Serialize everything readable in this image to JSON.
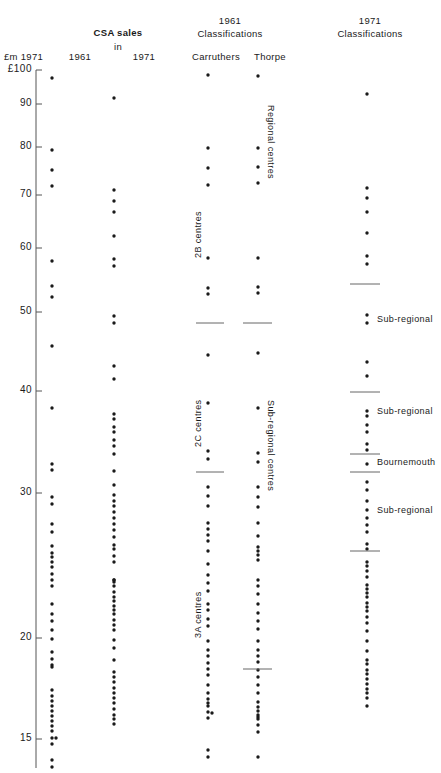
{
  "headers": {
    "csa_sales": "CSA sales",
    "in": "in",
    "axis_unit": "£m 1971",
    "col_1961": "1961",
    "col_1971": "1971",
    "classif_1961_year": "1961",
    "classif_1961": "Classifications",
    "classif_1971_year": "1971",
    "classif_1971": "Classifications",
    "carruthers": "Carruthers",
    "thorpe": "Thorpe"
  },
  "axis": {
    "ticks": [
      {
        "label": "£100",
        "value": 100,
        "y": 70
      },
      {
        "label": "90",
        "value": 90,
        "y": 104
      },
      {
        "label": "80",
        "value": 80,
        "y": 147
      },
      {
        "label": "70",
        "value": 70,
        "y": 195
      },
      {
        "label": "60",
        "value": 60,
        "y": 248
      },
      {
        "label": "50",
        "value": 50,
        "y": 312
      },
      {
        "label": "40",
        "value": 40,
        "y": 391
      },
      {
        "label": "30",
        "value": 30,
        "y": 493
      },
      {
        "label": "20",
        "value": 20,
        "y": 638
      },
      {
        "label": "15",
        "value": 15,
        "y": 739
      }
    ]
  },
  "annotations": {
    "carruthers_2b": "2B  centres",
    "carruthers_2c": "2C  centres",
    "carruthers_3a": "3A  centres",
    "thorpe_regional": "Regional  centres",
    "thorpe_subregional": "Sub-regional  centres",
    "c1971_subregional_1": "Sub-regional",
    "c1971_subregional_2": "Sub-regional",
    "c1971_bournemouth": "Bournemouth",
    "c1971_subregional_3": "Sub-regional"
  },
  "chart_data": {
    "type": "scatter",
    "ylabel": "£m 1971",
    "yscale": "log",
    "ylim": [
      14,
      100
    ],
    "yticks": [
      15,
      20,
      30,
      40,
      50,
      60,
      70,
      80,
      90,
      100
    ],
    "series": [
      {
        "name": "CSA sales 1961",
        "x": 52,
        "y_px": [
          78,
          150,
          170,
          186,
          261,
          286,
          297,
          346,
          408,
          464,
          470,
          497,
          504,
          524,
          532,
          546,
          553,
          557,
          562,
          567,
          574,
          580,
          586,
          604,
          614,
          621,
          630,
          639,
          652,
          659,
          665,
          667,
          690,
          696,
          701,
          706,
          711,
          716,
          721,
          726,
          731,
          738,
          738,
          744,
          760,
          767
        ]
      },
      {
        "name": "CSA sales 1971",
        "x": 114,
        "y_px": [
          98,
          190,
          201,
          212,
          236,
          259,
          266,
          316,
          323,
          366,
          379,
          414,
          419,
          427,
          432,
          440,
          446,
          454,
          471,
          485,
          495,
          501,
          506,
          512,
          518,
          524,
          530,
          537,
          545,
          549,
          556,
          562,
          580,
          582,
          580,
          586,
          592,
          597,
          601,
          606,
          610,
          614,
          620,
          625,
          630,
          640,
          648,
          660,
          672,
          677,
          682,
          688,
          693,
          698,
          703,
          709,
          715,
          719,
          724
        ]
      },
      {
        "name": "1961 Carruthers",
        "x": 208,
        "y_px": [
          75,
          148,
          168,
          185,
          258,
          288,
          294,
          355,
          403,
          451,
          459,
          487,
          496,
          506,
          523,
          529,
          535,
          541,
          551,
          564,
          575,
          583,
          591,
          604,
          610,
          619,
          626,
          641,
          650,
          656,
          663,
          669,
          675,
          685,
          693,
          699,
          703,
          706,
          712,
          713,
          718,
          750,
          757
        ]
      },
      {
        "name": "1961 Thorpe",
        "x": 258,
        "y_px": [
          76,
          148,
          167,
          183,
          258,
          287,
          293,
          353,
          408,
          453,
          462,
          487,
          497,
          507,
          523,
          536,
          547,
          551,
          555,
          560,
          580,
          586,
          594,
          604,
          613,
          621,
          629,
          641,
          650,
          656,
          662,
          670,
          677,
          685,
          693,
          702,
          707,
          711,
          715,
          717,
          719,
          725,
          732,
          757
        ]
      },
      {
        "name": "1971 Classifications",
        "x": 367,
        "y_px": [
          94,
          188,
          198,
          212,
          233,
          256,
          264,
          315,
          323,
          362,
          376,
          411,
          416,
          425,
          432,
          444,
          450,
          464,
          482,
          490,
          501,
          510,
          518,
          525,
          532,
          544,
          549,
          562,
          566,
          571,
          577,
          585,
          589,
          593,
          597,
          603,
          607,
          611,
          617,
          623,
          631,
          641,
          651,
          660,
          664,
          670,
          674,
          679,
          684,
          689,
          693,
          698,
          706
        ]
      }
    ],
    "class_boundaries": {
      "carruthers": [
        {
          "y_px": 323,
          "between": "2B / 2C"
        },
        {
          "y_px": 472,
          "between": "2C / 3A"
        }
      ],
      "thorpe": [
        {
          "y_px": 323,
          "between": "Regional / Sub-regional"
        },
        {
          "y_px": 669,
          "between": "Sub-regional / lower"
        }
      ],
      "classif_1971": [
        {
          "y_px": 284
        },
        {
          "y_px": 392
        },
        {
          "y_px": 454
        },
        {
          "y_px": 472
        },
        {
          "y_px": 551
        }
      ]
    },
    "region_labels": {
      "carruthers": [
        "2B centres",
        "2C centres",
        "3A centres"
      ],
      "thorpe": [
        "Regional centres",
        "Sub-regional centres"
      ],
      "classif_1971": [
        "Sub-regional",
        "Sub-regional",
        "Bournemouth",
        "Sub-regional"
      ]
    }
  }
}
